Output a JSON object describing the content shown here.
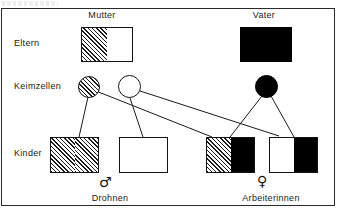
{
  "figure": {
    "title_remnant": "",
    "row_labels": [
      {
        "id": "eltern",
        "label": "Eltern"
      },
      {
        "id": "keimzellen",
        "label": "Keimzellen"
      },
      {
        "id": "kinder",
        "label": "Kinder"
      }
    ],
    "column_headers": [
      {
        "id": "mutter",
        "label": "Mutter"
      },
      {
        "id": "vater",
        "label": "Vater"
      }
    ],
    "bottom_labels": [
      {
        "id": "drohnen",
        "label": "Drohnen"
      },
      {
        "id": "arbeiterinnen",
        "label": "Arbeiterinnen"
      }
    ],
    "gender_symbols": [
      {
        "id": "male",
        "glyph": "♂"
      },
      {
        "id": "female",
        "glyph": "♀"
      }
    ],
    "parents": [
      {
        "id": "mutter-genotype",
        "left_fill": "hatch",
        "right_fill": "white"
      },
      {
        "id": "vater-genotype",
        "left_fill": "black",
        "right_fill": "black"
      }
    ],
    "germ_cells": [
      {
        "id": "mutter-egg-hatch",
        "fill": "hatch"
      },
      {
        "id": "mutter-egg-white",
        "fill": "white"
      },
      {
        "id": "vater-sperm-black",
        "fill": "black"
      }
    ],
    "children": [
      {
        "id": "drohne-hatch",
        "left_fill": "hatch",
        "right_fill": "hatch"
      },
      {
        "id": "drohne-white",
        "left_fill": "white",
        "right_fill": "white"
      },
      {
        "id": "arbeiterin-hatch-black",
        "left_fill": "hatch",
        "right_fill": "black"
      },
      {
        "id": "arbeiterin-white-black",
        "left_fill": "white",
        "right_fill": "black"
      }
    ],
    "colors": {
      "ink": "#141414",
      "paper": "#ffffff",
      "solid": "#000000"
    }
  }
}
